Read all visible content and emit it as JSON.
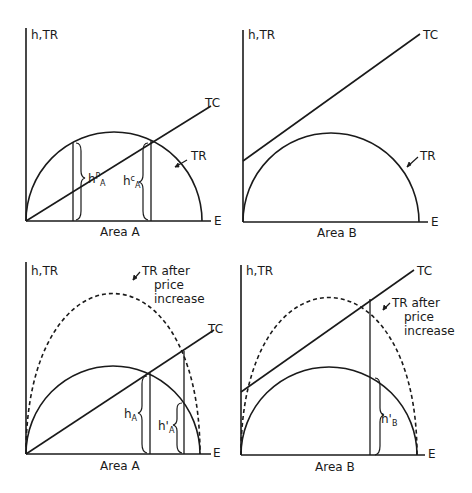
{
  "figure": {
    "panels": [
      {
        "id": "top-left",
        "y_axis_label": "h,TR",
        "x_axis_label": "E",
        "caption": "Area A",
        "tc_label": "TC",
        "tr_label": "TR",
        "h_p_label": {
          "base": "h",
          "sup": "P",
          "sub": "A"
        },
        "h_c_label": {
          "base": "h",
          "sup": "c",
          "sub": "A"
        }
      },
      {
        "id": "top-right",
        "y_axis_label": "h,TR",
        "x_axis_label": "E",
        "caption": "Area B",
        "tc_label": "TC",
        "tr_label": "TR"
      },
      {
        "id": "bottom-left",
        "y_axis_label": "h,TR",
        "x_axis_label": "E",
        "caption": "Area A",
        "tc_label": "TC",
        "tr_after_label_lines": [
          "TR after",
          "price",
          "increase"
        ],
        "h_label": {
          "base": "h",
          "sub": "A"
        },
        "h_prime_label": {
          "base": "h'",
          "sub": "A"
        }
      },
      {
        "id": "bottom-right",
        "y_axis_label": "h,TR",
        "x_axis_label": "E",
        "caption": "Area B",
        "tc_label": "TC",
        "tr_after_label_lines": [
          "TR after",
          "price",
          "increase"
        ],
        "h_prime_label": {
          "base": "h'",
          "sub": "B"
        }
      }
    ],
    "colors": {
      "line": "#1a1a1a",
      "background": "#ffffff"
    }
  }
}
